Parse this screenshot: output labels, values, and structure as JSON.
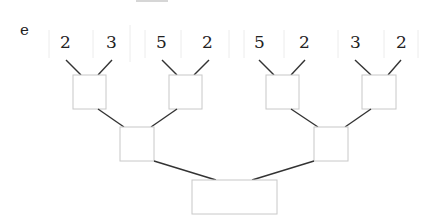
{
  "label": "e",
  "leaves": [
    "2",
    "3",
    "5",
    "2",
    "5",
    "2",
    "3",
    "2"
  ],
  "levels": {
    "level1_boxes": 4,
    "level2_boxes": 2,
    "root_boxes": 1
  },
  "colors": {
    "edge": "#333333",
    "box_border": "#c8c8c8",
    "divider": "#ececec",
    "text": "#222222"
  }
}
